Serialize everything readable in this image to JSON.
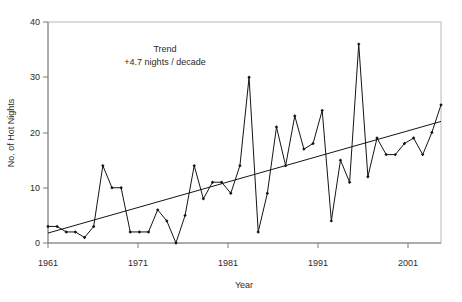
{
  "chart_data": {
    "type": "line",
    "title": "",
    "xlabel": "Year",
    "ylabel": "No. of Hot Nights",
    "xlim": [
      1961,
      2004
    ],
    "ylim": [
      0,
      40
    ],
    "ytick_values": [
      0,
      10,
      20,
      30,
      40
    ],
    "ytick_labels": [
      "0",
      "10",
      "20",
      "30",
      "40"
    ],
    "xtick_values": [
      1961,
      1971,
      1981,
      1991,
      2001
    ],
    "xtick_labels": [
      "1961",
      "1971",
      "1981",
      "1991",
      "2001"
    ],
    "grid": false,
    "legend": null,
    "annotations": [
      {
        "name": "trend-title",
        "text": "Trend"
      },
      {
        "name": "trend-rate",
        "text": "+4.7 nights / decade"
      }
    ],
    "series": [
      {
        "name": "No. of Hot Nights",
        "marker": "filled-diamond",
        "color": "#141414",
        "x": [
          1961,
          1962,
          1963,
          1964,
          1965,
          1966,
          1967,
          1968,
          1969,
          1970,
          1971,
          1972,
          1973,
          1974,
          1975,
          1976,
          1977,
          1978,
          1979,
          1980,
          1981,
          1982,
          1983,
          1984,
          1985,
          1986,
          1987,
          1988,
          1989,
          1990,
          1991,
          1992,
          1993,
          1994,
          1995,
          1996,
          1997,
          1998,
          1999,
          2000,
          2001,
          2002,
          2003,
          2004
        ],
        "values": [
          3,
          3,
          2,
          2,
          1,
          3,
          14,
          10,
          10,
          2,
          2,
          2,
          6,
          4,
          0,
          5,
          14,
          8,
          11,
          11,
          9,
          14,
          30,
          2,
          9,
          21,
          14,
          23,
          17,
          18,
          24,
          4,
          15,
          11,
          36,
          12,
          19,
          16,
          16,
          18,
          19,
          16,
          20,
          25
        ]
      }
    ],
    "trend": {
      "name": "linear-trend",
      "color": "#141414",
      "slope_per_decade": 4.7,
      "x_start": 1961,
      "x_end": 2004,
      "y_start": 1.8,
      "y_end": 22.0
    }
  }
}
